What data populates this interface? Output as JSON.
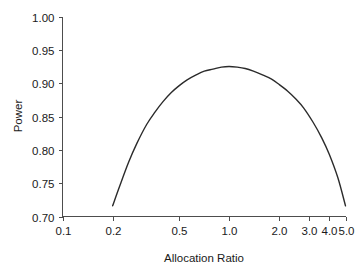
{
  "chart_data": {
    "type": "line",
    "title": "",
    "subtitle": "",
    "xlabel": "Allocation Ratio",
    "ylabel": "Power",
    "xscale": "log",
    "yscale": "linear",
    "xlim": [
      0.1,
      5.0
    ],
    "ylim": [
      0.7,
      1.0
    ],
    "grid": false,
    "legend": false,
    "legend_position": "none",
    "line_color": "#2b2b2b",
    "xticks": [
      0.1,
      0.2,
      0.5,
      1.0,
      2.0,
      3.0,
      4.0,
      5.0
    ],
    "xtick_labels": [
      "0.1",
      "0.2",
      "0.5",
      "1.0",
      "2.0",
      "3.0",
      "4.0",
      "5.0"
    ],
    "yticks": [
      0.7,
      0.75,
      0.8,
      0.85,
      0.9,
      0.95,
      1.0
    ],
    "ytick_labels": [
      "0.70",
      "0.75",
      "0.80",
      "0.85",
      "0.90",
      "0.95",
      "1.00"
    ],
    "series": [
      {
        "name": "Power",
        "x": [
          0.2,
          0.22,
          0.25,
          0.28,
          0.32,
          0.36,
          0.4,
          0.45,
          0.5,
          0.56,
          0.63,
          0.71,
          0.8,
          0.9,
          1.0,
          1.12,
          1.25,
          1.4,
          1.6,
          1.8,
          2.0,
          2.25,
          2.5,
          2.8,
          3.2,
          3.6,
          4.0,
          4.5,
          5.0
        ],
        "y": [
          0.716,
          0.745,
          0.782,
          0.81,
          0.838,
          0.857,
          0.872,
          0.886,
          0.896,
          0.905,
          0.912,
          0.918,
          0.921,
          0.924,
          0.925,
          0.924,
          0.922,
          0.918,
          0.912,
          0.906,
          0.898,
          0.888,
          0.877,
          0.863,
          0.841,
          0.818,
          0.793,
          0.758,
          0.716
        ]
      }
    ]
  }
}
